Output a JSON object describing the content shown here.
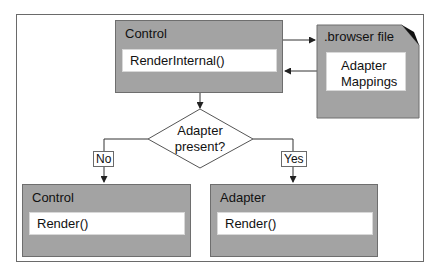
{
  "diagram": {
    "top_control": {
      "title": "Control",
      "method": "RenderInternal()"
    },
    "browser_file": {
      "title": ".browser file",
      "content_line1": "Adapter",
      "content_line2": "Mappings"
    },
    "decision": {
      "line1": "Adapter",
      "line2": "present?"
    },
    "branch_no": {
      "label": "No"
    },
    "branch_yes": {
      "label": "Yes"
    },
    "bottom_control": {
      "title": "Control",
      "method": "Render()"
    },
    "bottom_adapter": {
      "title": "Adapter",
      "method": "Render()"
    },
    "colors": {
      "box_fill": "#a3a3a3",
      "box_border": "#6e6e6e",
      "line": "#222222",
      "background": "#ffffff"
    }
  }
}
